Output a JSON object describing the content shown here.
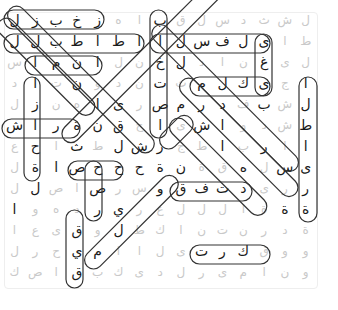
{
  "puzzle": {
    "type": "word-search",
    "language": "Arabic",
    "cols": 15,
    "rows": 13,
    "grid": [
      [
        "ل",
        "ز",
        "ب",
        "خ",
        "ز",
        "ه",
        "ا",
        "ب",
        "ق",
        "ل",
        "س",
        "د",
        "ث",
        "ش",
        "ل"
      ],
      [
        "ل",
        "ل",
        "ب",
        "ط",
        "ا",
        "ط",
        "ا",
        "ا",
        "ل",
        "س",
        "ف",
        "ل",
        "ى",
        "ا",
        "ط"
      ],
      [
        "س",
        "ا",
        "م",
        "ن",
        "ا",
        "ل",
        "ن",
        "خ",
        "ل",
        "د",
        "ا",
        "ن",
        "غ",
        "ى",
        "ل"
      ],
      [
        "د",
        "ا",
        "ت",
        "ن",
        "و",
        "د",
        "ن",
        "ت",
        "ث",
        "م",
        "ل",
        "ك",
        "ى",
        "ج",
        "ا"
      ],
      [
        "ل",
        "ز",
        "ن",
        "ه",
        "ا",
        "ى",
        "ر",
        "ص",
        "م",
        "ر",
        "د",
        "ف",
        "ب",
        "ش",
        "ل"
      ],
      [
        "ش",
        "ا",
        "ر",
        "ة",
        "ن",
        "ق",
        "ح",
        "ا",
        "ى",
        "ش",
        "ا",
        "و",
        "د",
        "ش",
        "ط"
      ],
      [
        "ع",
        "ح",
        "ا",
        "ث",
        "ط",
        "ل",
        "ش",
        "ر",
        "ج",
        "ط",
        "ا",
        "ب",
        "ر",
        "ا",
        "ا"
      ],
      [
        "ل",
        "ة",
        "ا",
        "ص",
        "ح",
        "ح",
        "ح",
        "ة",
        "ن",
        "ة",
        "ق",
        "ه",
        "ل",
        "س",
        "ى"
      ],
      [
        "ل",
        "ل",
        "ص",
        "ا",
        "ص",
        "ر",
        "س",
        "و",
        "ق",
        "ف",
        "ت",
        "د",
        "ى",
        "ر",
        "ر"
      ],
      [
        "ا",
        "و",
        "ه",
        "د",
        "ر",
        "ي",
        "ر",
        "ع",
        "ل",
        "ل",
        "ل",
        "ا",
        "ة",
        "ة",
        "ة"
      ],
      [
        "ا",
        "ع",
        "ى",
        "ق",
        "و",
        "ل",
        "ط",
        "ك",
        "ا",
        "ن",
        "ت",
        "ن",
        "ر",
        "د",
        "ة"
      ],
      [
        "ل",
        "ر",
        "ح",
        "ي",
        "م",
        "ا",
        "ا",
        "ل",
        "ى",
        "ت",
        "ر",
        "ك",
        "ق",
        "و",
        "و"
      ],
      [
        "ك",
        "ص",
        "ا",
        "ق",
        "ب",
        "ك",
        "ى",
        "د",
        "ل",
        "ر",
        "ى",
        "م",
        "ا",
        "ن",
        "و"
      ]
    ]
  },
  "found_words": [
    {
      "id": 1,
      "cells": "row1 c1-c5"
    },
    {
      "id": 2,
      "cells": "row2 c1-c7"
    },
    {
      "id": 3,
      "cells": "row3 c4-c7"
    },
    {
      "id": 4,
      "cells": "col8 r1-r4"
    },
    {
      "id": 5,
      "cells": "row2 c8-c13"
    },
    {
      "id": 6,
      "cells": "col13 r2-r5"
    },
    {
      "id": 7,
      "cells": "row4 c9-c13"
    },
    {
      "id": 8,
      "cells": "col15 r4-r10"
    },
    {
      "id": 9,
      "cells": "col4 r4-r8"
    },
    {
      "id": 10,
      "cells": "row6 c1-c5"
    },
    {
      "id": 11,
      "cells": "col8 r5-r7"
    },
    {
      "id": 12,
      "cells": "row8 c6-c8"
    },
    {
      "id": 13,
      "cells": "col7 r8-r10"
    },
    {
      "id": 14,
      "cells": "row9 c8-c12"
    },
    {
      "id": 15,
      "cells": "col4 r10-r13"
    },
    {
      "id": 16,
      "cells": "row12 c9-c12"
    }
  ],
  "colors": {
    "found_letter": "#1a1a1a",
    "unfound_letter": "#c9c9c9",
    "highlight_stroke": "#333333",
    "background": "#ffffff"
  }
}
